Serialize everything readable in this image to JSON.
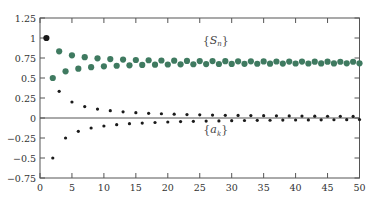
{
  "chart_data": {
    "type": "scatter",
    "title": "",
    "xlabel": "",
    "ylabel": "",
    "xlim": [
      0,
      50
    ],
    "ylim": [
      -0.75,
      1.25
    ],
    "xticks": [
      0,
      5,
      10,
      15,
      20,
      25,
      30,
      35,
      40,
      45,
      50
    ],
    "yticks": [
      -0.75,
      -0.5,
      -0.25,
      0,
      0.25,
      0.5,
      0.75,
      1,
      1.25
    ],
    "xtick_labels": [
      "0",
      "5",
      "10",
      "15",
      "20",
      "25",
      "30",
      "35",
      "40",
      "45",
      "50"
    ],
    "ytick_labels": [
      "−0.75",
      "−0.5",
      "−0.25",
      "0",
      "0.25",
      "0.5",
      "0.75",
      "1",
      "1.25"
    ],
    "grid": false,
    "zero_line": true,
    "colors": {
      "partial_sums": "#3f7a60",
      "terms": "#1a1a1a",
      "first_point": "#1a1a1a"
    },
    "series": [
      {
        "name": "{S_n}",
        "label_main": "S",
        "label_sub": "n",
        "description": "partial sums of alternating harmonic series",
        "x": [
          1,
          2,
          3,
          4,
          5,
          6,
          7,
          8,
          9,
          10,
          11,
          12,
          13,
          14,
          15,
          16,
          17,
          18,
          19,
          20,
          21,
          22,
          23,
          24,
          25,
          26,
          27,
          28,
          29,
          30,
          31,
          32,
          33,
          34,
          35,
          36,
          37,
          38,
          39,
          40,
          41,
          42,
          43,
          44,
          45,
          46,
          47,
          48,
          49,
          50
        ],
        "y": [
          1.0,
          0.5,
          0.833,
          0.583,
          0.783,
          0.617,
          0.76,
          0.635,
          0.746,
          0.646,
          0.737,
          0.653,
          0.73,
          0.659,
          0.725,
          0.663,
          0.722,
          0.666,
          0.719,
          0.669,
          0.716,
          0.671,
          0.714,
          0.672,
          0.712,
          0.674,
          0.711,
          0.675,
          0.71,
          0.676,
          0.709,
          0.677,
          0.708,
          0.678,
          0.707,
          0.679,
          0.706,
          0.68,
          0.705,
          0.681,
          0.705,
          0.681,
          0.704,
          0.682,
          0.704,
          0.682,
          0.703,
          0.683,
          0.703,
          0.683
        ]
      },
      {
        "name": "{a_k}",
        "label_main": "a",
        "label_sub": "k",
        "description": "terms (-1)^(k+1)/k",
        "x": [
          1,
          2,
          3,
          4,
          5,
          6,
          7,
          8,
          9,
          10,
          11,
          12,
          13,
          14,
          15,
          16,
          17,
          18,
          19,
          20,
          21,
          22,
          23,
          24,
          25,
          26,
          27,
          28,
          29,
          30,
          31,
          32,
          33,
          34,
          35,
          36,
          37,
          38,
          39,
          40,
          41,
          42,
          43,
          44,
          45,
          46,
          47,
          48,
          49,
          50
        ],
        "y": [
          1.0,
          -0.5,
          0.333,
          -0.25,
          0.2,
          -0.167,
          0.143,
          -0.125,
          0.111,
          -0.1,
          0.091,
          -0.083,
          0.077,
          -0.071,
          0.067,
          -0.063,
          0.059,
          -0.056,
          0.053,
          -0.05,
          0.048,
          -0.045,
          0.043,
          -0.042,
          0.04,
          -0.038,
          0.037,
          -0.036,
          0.034,
          -0.033,
          0.032,
          -0.031,
          0.03,
          -0.029,
          0.029,
          -0.028,
          0.027,
          -0.026,
          0.026,
          -0.025,
          0.024,
          -0.024,
          0.023,
          -0.023,
          0.022,
          -0.022,
          0.021,
          -0.021,
          0.02,
          -0.02
        ]
      }
    ],
    "annotations": [
      {
        "text": "{S_n}",
        "x": 27.5,
        "y": 0.93
      },
      {
        "text": "{a_k}",
        "x": 27.5,
        "y": -0.19
      }
    ]
  }
}
